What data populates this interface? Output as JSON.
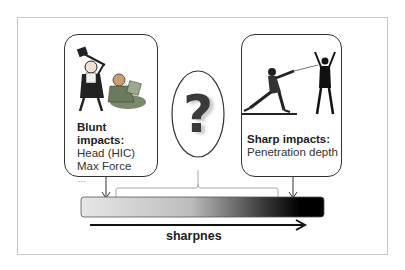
{
  "blunt": {
    "title_line1": "Blunt",
    "title_line2": "impacts:",
    "items": [
      "Head (HIC)",
      "Max Force"
    ],
    "ellipsis": "..."
  },
  "sharp": {
    "title": "Sharp impacts:",
    "items": [
      "Penetration depth"
    ]
  },
  "middle": {
    "symbol": "?"
  },
  "axis": {
    "label": "sharpnes",
    "gradient_start": "#e6e6e6",
    "gradient_end": "#000000"
  }
}
